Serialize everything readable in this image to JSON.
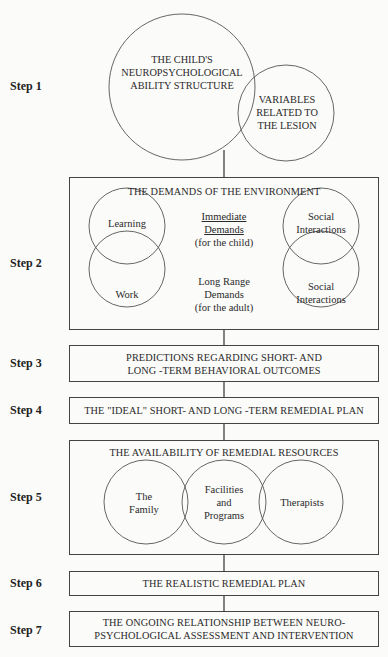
{
  "steps": [
    {
      "label": "Step 1"
    },
    {
      "label": "Step 2"
    },
    {
      "label": "Step 3"
    },
    {
      "label": "Step 4"
    },
    {
      "label": "Step 5"
    },
    {
      "label": "Step 6"
    },
    {
      "label": "Step 7"
    }
  ],
  "step1": {
    "main_circle": {
      "line1": "THE CHILD'S",
      "line2": "NEUROPSYCHOLOGICAL",
      "line3": "ABILITY STRUCTURE"
    },
    "side_circle": {
      "line1": "VARIABLES",
      "line2": "RELATED TO",
      "line3": "THE LESION"
    }
  },
  "step2": {
    "title": "THE DEMANDS OF THE ENVIRONMENT",
    "left_top": "Learning",
    "left_bottom": "Work",
    "right_top": {
      "line1": "Social",
      "line2": "Interactions"
    },
    "right_bottom": {
      "line1": "Social",
      "line2": "Interactions"
    },
    "immediate": {
      "line1": "Immediate",
      "line2": "Demands",
      "line3": "(for the child)"
    },
    "long_range": {
      "line1": "Long Range",
      "line2": "Demands",
      "line3": "(for the adult)"
    }
  },
  "step3": {
    "line1": "PREDICTIONS REGARDING SHORT- AND",
    "line2": "LONG -TERM BEHAVIORAL OUTCOMES"
  },
  "step4": {
    "text": "THE \"IDEAL\" SHORT- AND LONG -TERM REMEDIAL PLAN"
  },
  "step5": {
    "title": "THE AVAILABILITY OF REMEDIAL RESOURCES",
    "family": {
      "line1": "The",
      "line2": "Family"
    },
    "facilities": {
      "line1": "Facilities",
      "line2": "and",
      "line3": "Programs"
    },
    "therapists": "Therapists"
  },
  "step6": {
    "text": "THE REALISTIC REMEDIAL PLAN"
  },
  "step7": {
    "line1": "THE ONGOING RELATIONSHIP BETWEEN NEURO-",
    "line2": "PSYCHOLOGICAL ASSESSMENT AND INTERVENTION"
  },
  "colors": {
    "line": "#444444",
    "background": "#fbfbf9",
    "text": "#2a2a2a"
  }
}
